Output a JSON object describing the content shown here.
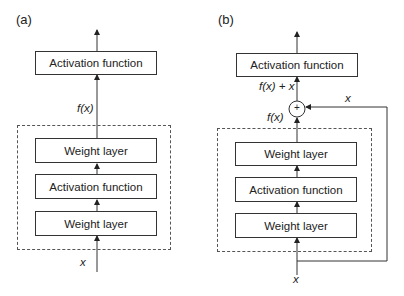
{
  "panels": [
    {
      "label": "(a)",
      "boxes": {
        "top": "Activation function",
        "stack": [
          "Weight layer",
          "Activation function",
          "Weight layer"
        ]
      },
      "labels": {
        "fx": "f(x)",
        "input": "x"
      }
    },
    {
      "label": "(b)",
      "boxes": {
        "top": "Activation function",
        "stack": [
          "Weight layer",
          "Activation function",
          "Weight layer"
        ]
      },
      "labels": {
        "fx_plus_x": "f(x) + x",
        "fx": "f(x)",
        "skip": "x",
        "input": "x",
        "plus": "+"
      }
    }
  ]
}
